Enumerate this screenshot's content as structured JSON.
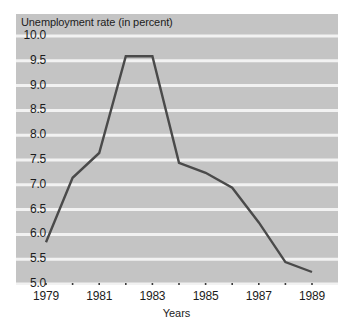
{
  "chart_data": {
    "type": "line",
    "title": "Unemployment rate (in percent)",
    "xlabel": "Years",
    "ylabel": "",
    "x": [
      1979,
      1980,
      1981,
      1982,
      1983,
      1984,
      1985,
      1986,
      1987,
      1988,
      1989
    ],
    "values": [
      5.6,
      6.9,
      7.4,
      9.35,
      9.35,
      7.2,
      7.0,
      6.7,
      6.0,
      5.2,
      5.0
    ],
    "series": [
      {
        "name": "Unemployment rate",
        "values": [
          5.6,
          6.9,
          7.4,
          9.35,
          9.35,
          7.2,
          7.0,
          6.7,
          6.0,
          5.2,
          5.0
        ]
      }
    ],
    "xlim": [
      1979,
      1989
    ],
    "ylim": [
      5.0,
      10.0
    ],
    "y_ticks": [
      "10.0",
      "9.5",
      "9.0",
      "8.5",
      "8.0",
      "7.5",
      "7.0",
      "6.5",
      "6.0",
      "5.5",
      "5.0"
    ],
    "y_tick_values": [
      10.0,
      9.5,
      9.0,
      8.5,
      8.0,
      7.5,
      7.0,
      6.5,
      6.0,
      5.5,
      5.0
    ],
    "x_ticks": [
      "1979",
      "1981",
      "1983",
      "1985",
      "1987",
      "1989"
    ],
    "x_tick_values": [
      1979,
      1981,
      1983,
      1985,
      1987,
      1989
    ],
    "x_minor_tick_values": [
      1979,
      1980,
      1981,
      1982,
      1983,
      1984,
      1985,
      1986,
      1987,
      1988,
      1989
    ],
    "grid": true,
    "grid_orientation": "horizontal",
    "legend": null,
    "colors": {
      "plot_background": "#c4c4c4",
      "gridline": "#f2f2f2",
      "line": "#4a4a4a",
      "text": "#1c1c1c",
      "page_background": "#ffffff"
    }
  }
}
